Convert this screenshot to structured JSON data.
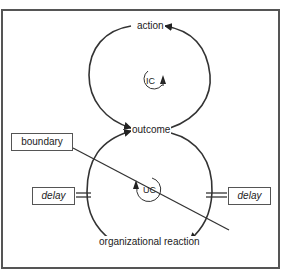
{
  "diagram": {
    "nodes": {
      "action": "action",
      "outcome": "outcome",
      "organizational_reaction": "organizational reaction"
    },
    "loops": {
      "upper": "IC",
      "lower": "UC"
    },
    "boxes": {
      "boundary": "boundary",
      "delay_left": "delay",
      "delay_right": "delay"
    },
    "colors": {
      "stroke": "#333333",
      "frame": "#555555",
      "background": "#ffffff"
    }
  }
}
